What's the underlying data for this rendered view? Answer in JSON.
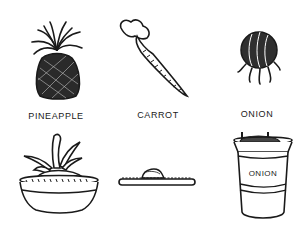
{
  "figure": {
    "top_row": [
      {
        "id": "pineapple",
        "label": "PINEAPPLE",
        "icon": "pineapple-icon"
      },
      {
        "id": "carrot",
        "label": "CARROT",
        "icon": "carrot-icon"
      },
      {
        "id": "onion",
        "label": "ONION",
        "icon": "onion-icon"
      }
    ],
    "bottom_row": [
      {
        "id": "pineapple-planted",
        "icon": "potted-pineapple-top-icon"
      },
      {
        "id": "carrot-planted",
        "icon": "carrot-top-in-dish-icon"
      },
      {
        "id": "onion-planted",
        "icon": "onion-in-cup-icon",
        "cup_label": "ONION"
      }
    ]
  },
  "colors": {
    "ink": "#1a1a1a",
    "background": "#ffffff"
  }
}
